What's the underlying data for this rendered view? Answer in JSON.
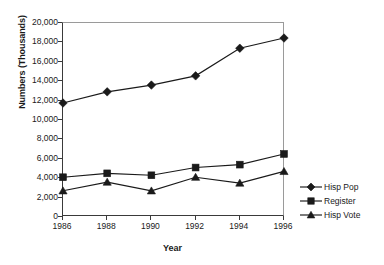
{
  "chart_data": {
    "type": "line",
    "title": "",
    "xlabel": "Year",
    "ylabel": "Numbers (Thousands)",
    "categories": [
      "1986",
      "1988",
      "1990",
      "1992",
      "1994",
      "1996"
    ],
    "x": [
      1986,
      1988,
      1990,
      1992,
      1994,
      1996
    ],
    "xlim": [
      1986,
      1996
    ],
    "ylim": [
      0,
      20000
    ],
    "ytick_labels": [
      "20,000",
      "18,000",
      "16,000",
      "14,000",
      "12,000",
      "10,000",
      "8,000",
      "6,000",
      "4,000",
      "2,000",
      "0"
    ],
    "ytick_values": [
      20000,
      18000,
      16000,
      14000,
      12000,
      10000,
      8000,
      6000,
      4000,
      2000,
      0
    ],
    "xtick_labels": [
      "1986",
      "1988",
      "1990",
      "1992",
      "1994",
      "1996"
    ],
    "grid": false,
    "legend_position": "right",
    "series": [
      {
        "name": "Hisp Pop",
        "marker": "diamond",
        "color": "#1a1a1a",
        "values": [
          11750,
          12900,
          13600,
          14550,
          17400,
          18450
        ]
      },
      {
        "name": "Register",
        "marker": "square",
        "color": "#1a1a1a",
        "values": [
          4100,
          4500,
          4300,
          5100,
          5400,
          6500
        ]
      },
      {
        "name": "Hisp Vote",
        "marker": "triangle",
        "color": "#1a1a1a",
        "values": [
          2700,
          3600,
          2700,
          4100,
          3500,
          4700
        ]
      }
    ]
  },
  "axes": {
    "y_title": "Numbers (Thousands)",
    "x_title": "Year"
  },
  "legend": {
    "items": [
      {
        "label": "Hisp Pop",
        "marker": "diamond-marker-icon"
      },
      {
        "label": "Register",
        "marker": "square-marker-icon"
      },
      {
        "label": "Hisp Vote",
        "marker": "triangle-marker-icon"
      }
    ]
  }
}
